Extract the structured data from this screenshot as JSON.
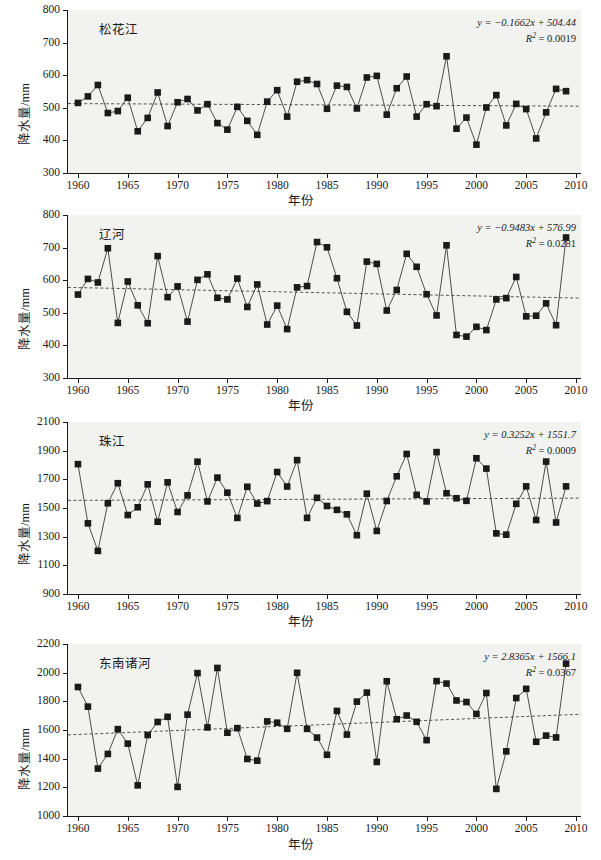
{
  "figure": {
    "xlabel": "年份",
    "ylabel": "降水量/mm",
    "marker_color": "#1a1a1a",
    "line_color": "#3a3a3a",
    "trend_color": "#55524e",
    "plot_bg": "#f2f2f0"
  },
  "chart_data": [
    {
      "type": "line",
      "title": "松花江",
      "xlabel": "年份",
      "ylabel": "降水量/mm",
      "xlim": [
        1959,
        2010.5
      ],
      "ylim": [
        300,
        800
      ],
      "yticks": [
        300,
        400,
        500,
        600,
        700,
        800
      ],
      "xticks": [
        1960,
        1965,
        1970,
        1975,
        1980,
        1985,
        1990,
        1995,
        2000,
        2005,
        2010
      ],
      "grid": false,
      "legend": "none",
      "equation": "y = −0.1662x + 504.44",
      "equation_slope": -0.1662,
      "equation_intercept": 504.44,
      "r2_label": "R2 = 0.0019",
      "r2": 0.0019,
      "trendline": {
        "y_start": 513,
        "y_end": 505
      },
      "x": [
        1960,
        1961,
        1962,
        1963,
        1964,
        1965,
        1966,
        1967,
        1968,
        1969,
        1970,
        1971,
        1972,
        1973,
        1974,
        1975,
        1976,
        1977,
        1978,
        1979,
        1980,
        1981,
        1982,
        1983,
        1984,
        1985,
        1986,
        1987,
        1988,
        1989,
        1990,
        1991,
        1992,
        1993,
        1994,
        1995,
        1996,
        1997,
        1998,
        1999,
        2000,
        2001,
        2002,
        2003,
        2004,
        2005,
        2006,
        2007,
        2008,
        2009
      ],
      "values": [
        515,
        535,
        570,
        484,
        490,
        531,
        428,
        469,
        547,
        444,
        517,
        527,
        492,
        511,
        453,
        433,
        503,
        460,
        417,
        519,
        554,
        473,
        580,
        585,
        573,
        497,
        568,
        564,
        498,
        593,
        598,
        479,
        560,
        596,
        473,
        511,
        505,
        658,
        436,
        470,
        387,
        501,
        539,
        446,
        512,
        496,
        406,
        486,
        558,
        551
      ]
    },
    {
      "type": "line",
      "title": "辽河",
      "xlabel": "年份",
      "ylabel": "降水量/mm",
      "xlim": [
        1959,
        2010.5
      ],
      "ylim": [
        300,
        800
      ],
      "yticks": [
        300,
        400,
        500,
        600,
        700,
        800
      ],
      "xticks": [
        1960,
        1965,
        1970,
        1975,
        1980,
        1985,
        1990,
        1995,
        2000,
        2005,
        2010
      ],
      "grid": false,
      "legend": "none",
      "equation": "y = −0.9483x + 576.99",
      "equation_slope": -0.9483,
      "equation_intercept": 576.99,
      "r2_label": "R2 = 0.0281",
      "r2": 0.0281,
      "trendline": {
        "y_start": 578,
        "y_end": 545
      },
      "x": [
        1960,
        1961,
        1962,
        1963,
        1964,
        1965,
        1966,
        1967,
        1968,
        1969,
        1970,
        1971,
        1972,
        1973,
        1974,
        1975,
        1976,
        1977,
        1978,
        1979,
        1980,
        1981,
        1982,
        1983,
        1984,
        1985,
        1986,
        1987,
        1988,
        1989,
        1990,
        1991,
        1992,
        1993,
        1994,
        1995,
        1996,
        1997,
        1998,
        1999,
        2000,
        2001,
        2002,
        2003,
        2004,
        2005,
        2006,
        2007,
        2008,
        2009
      ],
      "values": [
        556,
        604,
        593,
        698,
        469,
        596,
        523,
        468,
        674,
        548,
        581,
        473,
        601,
        618,
        546,
        541,
        605,
        518,
        587,
        464,
        522,
        450,
        578,
        582,
        717,
        701,
        606,
        503,
        461,
        657,
        650,
        507,
        570,
        681,
        641,
        557,
        492,
        707,
        432,
        427,
        457,
        447,
        541,
        545,
        610,
        489,
        491,
        529,
        462,
        731
      ]
    },
    {
      "type": "line",
      "title": "珠江",
      "xlabel": "年份",
      "ylabel": "降水量/mm",
      "xlim": [
        1959,
        2010.5
      ],
      "ylim": [
        900,
        2100
      ],
      "yticks": [
        900,
        1100,
        1300,
        1500,
        1700,
        1900,
        2100
      ],
      "xticks": [
        1960,
        1965,
        1970,
        1975,
        1980,
        1985,
        1990,
        1995,
        2000,
        2005,
        2010
      ],
      "grid": false,
      "legend": "none",
      "equation": "y = 0.3252x + 1551.7",
      "equation_slope": 0.3252,
      "equation_intercept": 1551.7,
      "r2_label": "R2 = 0.0009",
      "r2": 0.0009,
      "trendline": {
        "y_start": 1553,
        "y_end": 1569
      },
      "x": [
        1960,
        1961,
        1962,
        1963,
        1964,
        1965,
        1966,
        1967,
        1968,
        1969,
        1970,
        1971,
        1972,
        1973,
        1974,
        1975,
        1976,
        1977,
        1978,
        1979,
        1980,
        1981,
        1982,
        1983,
        1984,
        1985,
        1986,
        1987,
        1988,
        1989,
        1990,
        1991,
        1992,
        1993,
        1994,
        1995,
        1996,
        1997,
        1998,
        1999,
        2000,
        2001,
        2002,
        2003,
        2004,
        2005,
        2006,
        2007,
        2008,
        2009
      ],
      "values": [
        1806,
        1393,
        1201,
        1533,
        1673,
        1451,
        1505,
        1665,
        1404,
        1679,
        1472,
        1588,
        1823,
        1546,
        1712,
        1607,
        1431,
        1648,
        1531,
        1548,
        1751,
        1650,
        1834,
        1431,
        1571,
        1514,
        1487,
        1456,
        1310,
        1600,
        1340,
        1549,
        1721,
        1877,
        1592,
        1546,
        1890,
        1603,
        1568,
        1550,
        1847,
        1775,
        1323,
        1314,
        1529,
        1651,
        1416,
        1824,
        1399,
        1651
      ]
    },
    {
      "type": "line",
      "title": "东南诸河",
      "xlabel": "年份",
      "ylabel": "降水量/mm",
      "xlim": [
        1959,
        2010.5
      ],
      "ylim": [
        1000,
        2200
      ],
      "yticks": [
        1000,
        1200,
        1400,
        1600,
        1800,
        2000,
        2200
      ],
      "xticks": [
        1960,
        1965,
        1970,
        1975,
        1980,
        1985,
        1990,
        1995,
        2000,
        2005,
        2010
      ],
      "grid": false,
      "legend": "none",
      "equation": "y = 2.8365x + 1566.1",
      "equation_slope": 2.8365,
      "equation_intercept": 1566.1,
      "r2_label": "R2 = 0.0367",
      "r2": 0.0367,
      "trendline": {
        "y_start": 1566,
        "y_end": 1710
      },
      "x": [
        1960,
        1961,
        1962,
        1963,
        1964,
        1965,
        1966,
        1967,
        1968,
        1969,
        1970,
        1971,
        1972,
        1973,
        1974,
        1975,
        1976,
        1977,
        1978,
        1979,
        1980,
        1981,
        1982,
        1983,
        1984,
        1985,
        1986,
        1987,
        1988,
        1989,
        1990,
        1991,
        1992,
        1993,
        1994,
        1995,
        1996,
        1997,
        1998,
        1999,
        2000,
        2001,
        2002,
        2003,
        2004,
        2005,
        2006,
        2007,
        2008,
        2009
      ],
      "values": [
        1900,
        1763,
        1331,
        1433,
        1606,
        1505,
        1214,
        1565,
        1656,
        1692,
        1203,
        1707,
        1997,
        1618,
        2033,
        1581,
        1613,
        1398,
        1386,
        1660,
        1651,
        1608,
        1999,
        1608,
        1547,
        1427,
        1733,
        1568,
        1798,
        1861,
        1377,
        1940,
        1675,
        1701,
        1657,
        1529,
        1941,
        1924,
        1806,
        1795,
        1712,
        1858,
        1189,
        1451,
        1823,
        1887,
        1518,
        1561,
        1548,
        2063
      ]
    }
  ]
}
